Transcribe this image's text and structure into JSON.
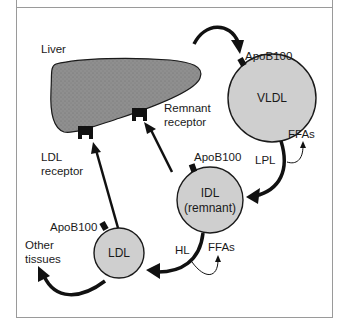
{
  "caption": "",
  "labels": {
    "liver": "Liver",
    "remnant_receptor_line1": "Remnant",
    "remnant_receptor_line2": "receptor",
    "ldl_receptor_line1": "LDL",
    "ldl_receptor_line2": "receptor",
    "apob_vldl": "ApoB100",
    "apob_idl": "ApoB100",
    "apob_ldl": "ApoB100",
    "lpl": "LPL",
    "hl": "HL",
    "ffas_1": "FFAs",
    "ffas_2": "FFAs",
    "other_tissues_line1": "Other",
    "other_tissues_line2": "tissues"
  },
  "particles": {
    "vldl": "VLDL",
    "idl_line1": "IDL",
    "idl_line2": "(remnant)",
    "ldl": "LDL"
  },
  "colors": {
    "liver_fill": "#8f8f8f",
    "particle_fill": "#cfcfcf",
    "stroke": "#1a1a1a",
    "frame": "#9a9a9a"
  }
}
